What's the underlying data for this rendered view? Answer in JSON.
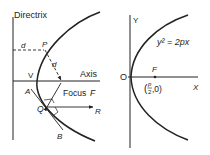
{
  "left_panel": {
    "directrix_label": "Directrix",
    "axis_label": "Axis",
    "focus_label": "Focus",
    "focus_letter": "F",
    "vertex_label": "V",
    "point_p_label": "P",
    "point_q_label": "Q",
    "distance_label_horizontal": "d",
    "distance_label_diagonal": "d",
    "tangent_end_a": "A",
    "tangent_end_b": "B",
    "ray_end_r": "R"
  },
  "right_panel": {
    "y_axis_label": "Y",
    "x_axis_label": "X",
    "origin_label": "O",
    "focus_label": "F",
    "equation": "y² = 2px",
    "focus_coord_open": "(",
    "focus_coord_num": "p",
    "focus_coord_den": "2",
    "focus_coord_rest": ",0)"
  },
  "colors": {
    "ink": "#222222",
    "background": "#ffffff"
  }
}
